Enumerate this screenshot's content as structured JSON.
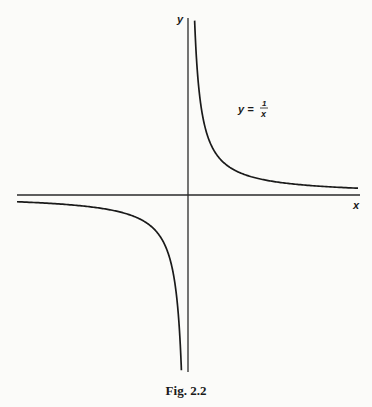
{
  "chart_data": {
    "type": "line",
    "title": "",
    "caption": "Fig. 2.2",
    "xlabel": "x",
    "ylabel": "y",
    "function": "y = 1/x",
    "curve_label": {
      "lhs": "y =",
      "num": "1",
      "den": "x"
    },
    "grid": false,
    "legend": "none",
    "axes_style": "cross through origin, no ticks",
    "xlim": [
      -5.1,
      5.4
    ],
    "ylim": [
      -5.2,
      5.1
    ],
    "series": [
      {
        "name": "y = 1/x (x > 0)",
        "x": [
          0.2,
          0.25,
          0.33,
          0.5,
          1,
          2,
          3,
          4,
          5
        ],
        "y": [
          5,
          4,
          3,
          2,
          1,
          0.5,
          0.333,
          0.25,
          0.2
        ]
      },
      {
        "name": "y = 1/x (x < 0)",
        "x": [
          -5,
          -4,
          -3,
          -2,
          -1,
          -0.5,
          -0.33,
          -0.25,
          -0.2
        ],
        "y": [
          -0.2,
          -0.25,
          -0.333,
          -0.5,
          -1,
          -2,
          -3,
          -4,
          -5
        ]
      }
    ],
    "colors": {
      "curve": "#1a1a1a",
      "axes": "#2a2a2a",
      "background": "#fbfbf9"
    }
  }
}
